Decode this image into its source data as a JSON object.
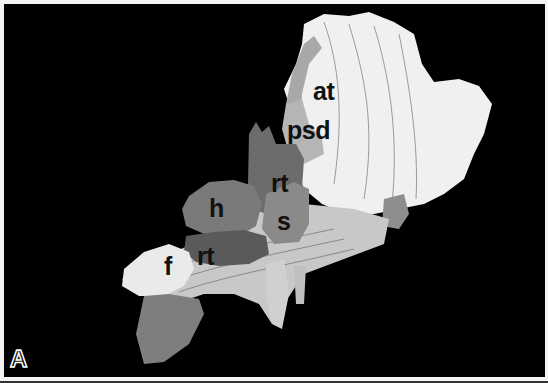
{
  "figure": {
    "panel_label": "A",
    "background": "#000000",
    "regions": [
      {
        "id": "at",
        "label": "at",
        "tone": "#f2f2f2"
      },
      {
        "id": "psd",
        "label": "psd",
        "tone": "#b8b8b8"
      },
      {
        "id": "rt-upper",
        "label": "rt",
        "tone": "#6e6e6e"
      },
      {
        "id": "s",
        "label": "s",
        "tone": "#8a8a8a"
      },
      {
        "id": "h",
        "label": "h",
        "tone": "#7c7c7c"
      },
      {
        "id": "rt-lower",
        "label": "rt",
        "tone": "#5c5c5c"
      },
      {
        "id": "f",
        "label": "f",
        "tone": "#ececec"
      }
    ]
  }
}
